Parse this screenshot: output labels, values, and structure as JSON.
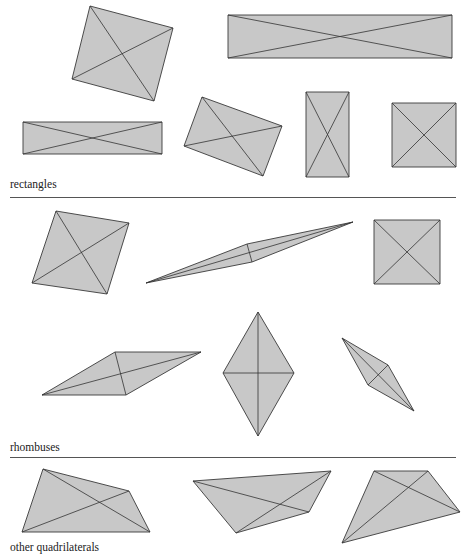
{
  "sections": [
    {
      "label": "rectangles",
      "shapes": [
        {
          "id": "rect-tilted-large",
          "points": [
            [
              90,
              6
            ],
            [
              173,
              28
            ],
            [
              154,
              101
            ],
            [
              72,
              79
            ]
          ]
        },
        {
          "id": "rect-wide-top",
          "points": [
            [
              228,
              15
            ],
            [
              452,
              15
            ],
            [
              452,
              58
            ],
            [
              228,
              58
            ]
          ]
        },
        {
          "id": "rect-wide-left",
          "points": [
            [
              23,
              122
            ],
            [
              162,
              122
            ],
            [
              162,
              154
            ],
            [
              23,
              154
            ]
          ]
        },
        {
          "id": "rect-tilted-small",
          "points": [
            [
              202,
              97
            ],
            [
              282,
              126
            ],
            [
              263,
              176
            ],
            [
              184,
              146
            ]
          ]
        },
        {
          "id": "rect-tall",
          "points": [
            [
              306,
              92
            ],
            [
              349,
              92
            ],
            [
              349,
              177
            ],
            [
              306,
              177
            ]
          ]
        },
        {
          "id": "rect-square",
          "points": [
            [
              392,
              103
            ],
            [
              456,
              103
            ],
            [
              456,
              167
            ],
            [
              392,
              167
            ]
          ]
        }
      ]
    },
    {
      "label": "rhombuses",
      "shapes": [
        {
          "id": "rhombus-tilted-square",
          "points": [
            [
              56,
              211
            ],
            [
              129,
              223
            ],
            [
              107,
              294
            ],
            [
              32,
              283
            ]
          ]
        },
        {
          "id": "rhombus-needle",
          "points": [
            [
              146,
              283
            ],
            [
              247,
              244
            ],
            [
              353,
              222
            ],
            [
              252,
              262
            ]
          ]
        },
        {
          "id": "rhombus-square",
          "points": [
            [
              374,
              220
            ],
            [
              440,
              220
            ],
            [
              440,
              284
            ],
            [
              374,
              284
            ]
          ]
        },
        {
          "id": "rhombus-flat",
          "points": [
            [
              42,
              395
            ],
            [
              115,
              352
            ],
            [
              201,
              352
            ],
            [
              126,
              395
            ]
          ]
        },
        {
          "id": "rhombus-vertical",
          "points": [
            [
              258,
              312
            ],
            [
              294,
              373
            ],
            [
              258,
              436
            ],
            [
              223,
              373
            ]
          ]
        },
        {
          "id": "rhombus-diagonal",
          "points": [
            [
              342,
              338
            ],
            [
              388,
              365
            ],
            [
              414,
              411
            ],
            [
              368,
              385
            ]
          ]
        }
      ]
    },
    {
      "label": "other quadrilaterals",
      "shapes": [
        {
          "id": "quad-1",
          "points": [
            [
              43,
              469
            ],
            [
              129,
              491
            ],
            [
              150,
              532
            ],
            [
              22,
              532
            ]
          ]
        },
        {
          "id": "quad-2",
          "points": [
            [
              193,
              481
            ],
            [
              331,
              471
            ],
            [
              309,
              512
            ],
            [
              236,
              533
            ]
          ]
        },
        {
          "id": "quad-3",
          "points": [
            [
              374,
              471
            ],
            [
              428,
              471
            ],
            [
              460,
              512
            ],
            [
              342,
              543
            ]
          ]
        }
      ]
    }
  ],
  "layout": {
    "labels": [
      {
        "text_path": "sections.0.label",
        "x": 10,
        "y": 178
      },
      {
        "text_path": "sections.1.label",
        "x": 10,
        "y": 441
      },
      {
        "text_path": "sections.2.label",
        "x": 10,
        "y": 541
      }
    ],
    "dividers": [
      {
        "x": 10,
        "y": 197,
        "width": 446
      },
      {
        "x": 10,
        "y": 457,
        "width": 446
      }
    ]
  },
  "colors": {
    "fill": "#c8c8c8",
    "stroke": "#3a3a3a",
    "divider": "#555555",
    "text": "#222222"
  }
}
